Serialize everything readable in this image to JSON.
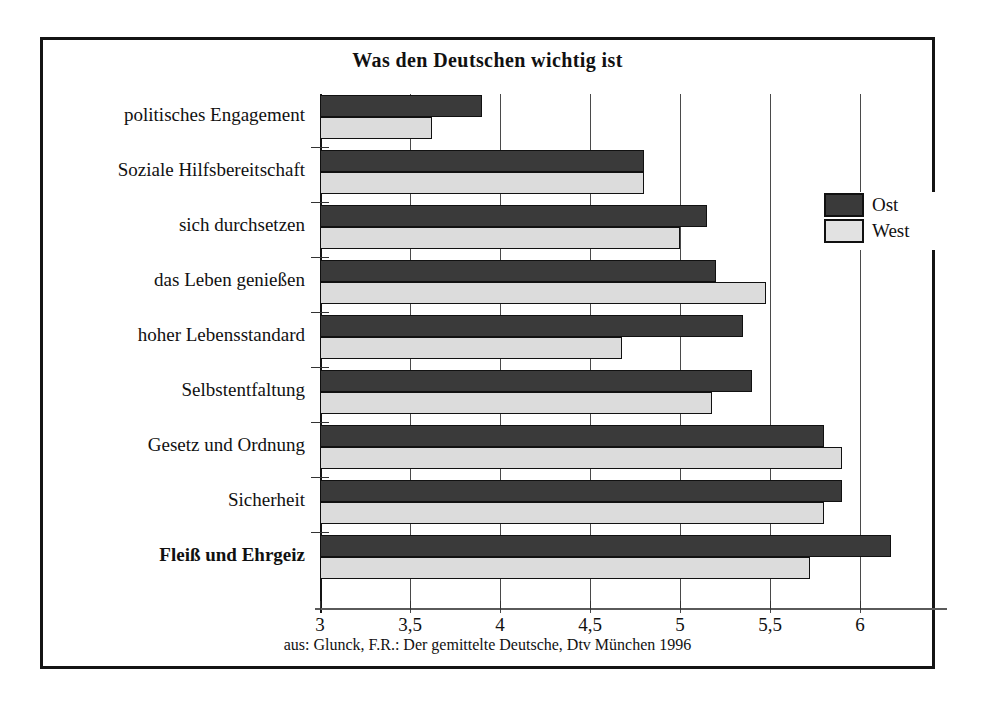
{
  "figure": {
    "title": "Was den Deutschen wichtig ist",
    "source": "aus: Glunck, F.R.: Der gemittelte Deutsche, Dtv München 1996"
  },
  "legend": {
    "items": [
      {
        "label": "Ost",
        "color": "#3a3a3a",
        "icon": "legend-swatch-dark"
      },
      {
        "label": "West",
        "color": "#e2e2e2",
        "icon": "legend-swatch-light"
      }
    ]
  },
  "axis": {
    "ticks": [
      {
        "value": 3,
        "label": "3"
      },
      {
        "value": 3.5,
        "label": "3,5"
      },
      {
        "value": 4,
        "label": "4"
      },
      {
        "value": 4.5,
        "label": "4,5"
      },
      {
        "value": 5,
        "label": "5"
      },
      {
        "value": 5.5,
        "label": "5,5"
      },
      {
        "value": 6,
        "label": "6"
      }
    ]
  },
  "chart_data": {
    "type": "bar",
    "orientation": "horizontal",
    "title": "Was den Deutschen wichtig ist",
    "xlabel": "",
    "ylabel": "",
    "xlim": [
      3,
      6.45
    ],
    "xticks": [
      3,
      3.5,
      4,
      4.5,
      5,
      5.5,
      6
    ],
    "xticklabels": [
      "3",
      "3,5",
      "4",
      "4,5",
      "5",
      "5,5",
      "6"
    ],
    "grid": true,
    "grid_axis": "x",
    "legend_position": "right-upper",
    "categories": [
      "politisches Engagement",
      "Soziale Hilfsbereitschaft",
      "sich durchsetzen",
      "das Leben genießen",
      "hoher Lebensstandard",
      "Selbstentfaltung",
      "Gesetz und Ordnung",
      "Sicherheit",
      "Fleiß und Ehrgeiz"
    ],
    "emphasized_categories": [
      "Fleiß und Ehrgeiz"
    ],
    "series": [
      {
        "name": "Ost",
        "color": "#3a3a3a",
        "values": [
          3.9,
          4.8,
          5.15,
          5.2,
          5.35,
          5.4,
          5.8,
          5.9,
          6.17
        ]
      },
      {
        "name": "West",
        "color": "#dcdcdc",
        "values": [
          3.62,
          4.8,
          5.0,
          5.48,
          4.68,
          5.18,
          5.9,
          5.8,
          5.72
        ]
      }
    ]
  }
}
